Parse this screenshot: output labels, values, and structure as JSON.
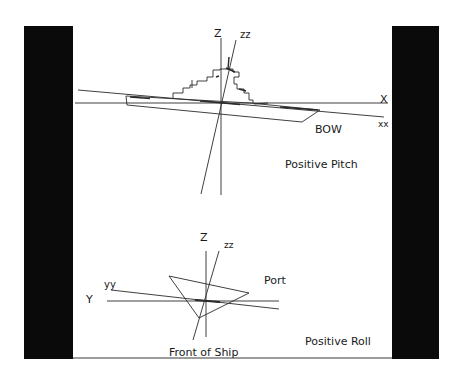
{
  "colors": {
    "background": "#ffffff",
    "panel_bars": "#0a0a0a",
    "lines": "#2a2a2a",
    "text": "#1a1a1a"
  },
  "pitch_diagram": {
    "labels": {
      "z_axis": "Z",
      "zz_axis": "zz",
      "x_axis": "X",
      "xx_axis": "xx",
      "bow": "BOW",
      "caption": "Positive Pitch"
    }
  },
  "roll_diagram": {
    "labels": {
      "z_axis": "Z",
      "zz_axis": "zz",
      "y_axis": "Y",
      "yy_axis": "yy",
      "port": "Port",
      "front": "Front of Ship",
      "caption": "Positive Roll"
    }
  }
}
